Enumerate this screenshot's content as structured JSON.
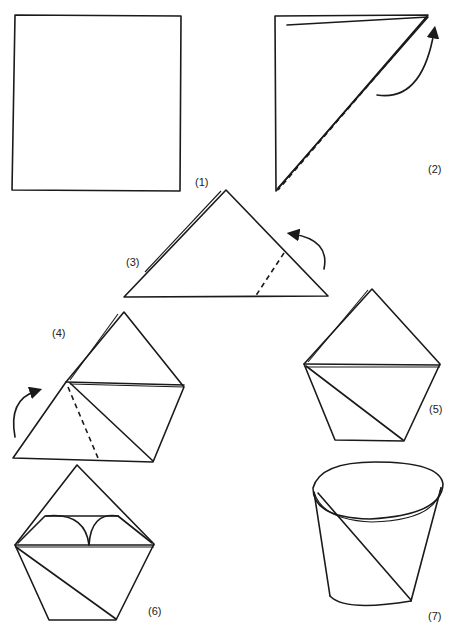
{
  "diagram": {
    "steps": [
      {
        "id": 1,
        "label": "(1)",
        "shape": "square sheet"
      },
      {
        "id": 2,
        "label": "(2)",
        "shape": "fold diagonally corner to corner"
      },
      {
        "id": 3,
        "label": "(3)",
        "shape": "triangle, fold right corner across"
      },
      {
        "id": 4,
        "label": "(4)",
        "shape": "fold left corner across"
      },
      {
        "id": 5,
        "label": "(5)",
        "shape": "folded pentagon"
      },
      {
        "id": 6,
        "label": "(6)",
        "shape": "fold top flaps down"
      },
      {
        "id": 7,
        "label": "(7)",
        "shape": "open cup"
      }
    ],
    "line_color": "#1a1a1a",
    "background": "#ffffff"
  }
}
